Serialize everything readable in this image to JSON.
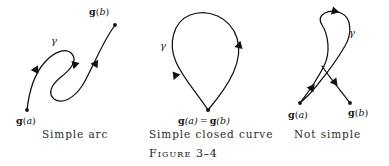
{
  "figure": {
    "caption_word": "Figure",
    "caption_number": "3–4",
    "background_color": "#ffffff",
    "ink_color": "#111111"
  },
  "panels": [
    {
      "id": "simple-arc",
      "caption": "Simple arc",
      "curve_label": "γ",
      "endpoints": [
        {
          "name": "start",
          "text_bold": "g",
          "text_paren_open": "(",
          "text_italic": "a",
          "text_paren_close": ")"
        },
        {
          "name": "end",
          "text_bold": "g",
          "text_paren_open": "(",
          "text_italic": "b",
          "text_paren_close": ")"
        }
      ],
      "start_label": "g(a)",
      "end_label": "g(b)"
    },
    {
      "id": "simple-closed-curve",
      "caption": "Simple closed curve",
      "curve_label": "γ",
      "joint_label_bold_1": "g",
      "joint_label_arg_1": "(a)",
      "joint_label_equals": "=",
      "joint_label_bold_2": "g",
      "joint_label_arg_2": "(b)"
    },
    {
      "id": "not-simple",
      "caption": "Not simple",
      "curve_label": "γ",
      "start_label": "g(a)",
      "end_label": "g(b)"
    }
  ],
  "glyphs": {
    "bold_g": "g",
    "paren_open": "(",
    "paren_close": ")",
    "arg_a": "a",
    "arg_b": "b",
    "equals": "=",
    "gamma": "γ"
  }
}
